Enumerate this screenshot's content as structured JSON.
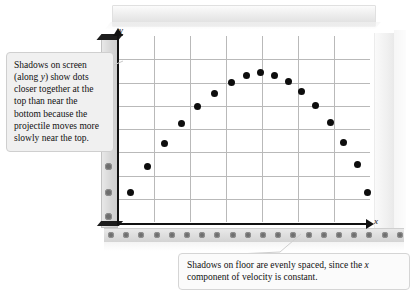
{
  "figure": {
    "type": "projectile-motion-diagram",
    "axis_labels": {
      "y": "y",
      "x": "x"
    }
  },
  "callouts": {
    "left": {
      "text": "Shadows on screen (along y) show dots closer together at the top than near the bottom because the projectile moves more slowly near the top."
    },
    "bottom": {
      "text": "Shadows on floor are evenly spaced, since the x component of velocity is constant."
    }
  },
  "chart_data": {
    "type": "scatter",
    "title": "",
    "xlabel": "x",
    "ylabel": "y",
    "grid": true,
    "legend": "none",
    "xlim": [
      0,
      6
    ],
    "ylim": [
      0,
      7
    ],
    "grid_lines": {
      "vertical": 6,
      "horizontal": 7
    },
    "series": [
      {
        "name": "projectile trajectory",
        "x": [
          0.3,
          0.7,
          1.1,
          1.5,
          1.9,
          2.3,
          2.7,
          3.05,
          3.4,
          3.72,
          4.05,
          4.38,
          4.7,
          5.05,
          5.38,
          5.7,
          5.95
        ],
        "y": [
          1.1,
          2.1,
          2.95,
          3.7,
          4.35,
          4.85,
          5.25,
          5.5,
          5.62,
          5.52,
          5.28,
          4.9,
          4.4,
          3.75,
          3.0,
          2.15,
          1.12
        ]
      }
    ],
    "y_axis_shadows": {
      "name": "shadows on screen (along y)",
      "description": "dots closer together near the top, farther apart near the bottom",
      "values": [
        5.62,
        5.28,
        4.9,
        4.35,
        3.7,
        2.95,
        2.1,
        1.1,
        0.2
      ]
    },
    "x_axis_shadows": {
      "name": "shadows on floor (along x)",
      "description": "evenly spaced dots",
      "count": 20,
      "spacing": "uniform"
    }
  }
}
